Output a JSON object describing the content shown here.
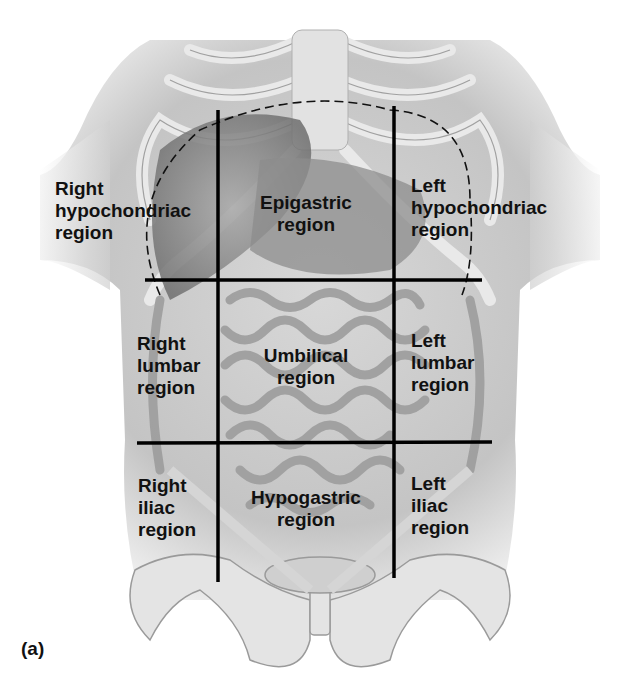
{
  "figure_label": "(a)",
  "regions": {
    "right_hypochondriac": "Right\nhypochondriac\nregion",
    "epigastric": "Epigastric\nregion",
    "left_hypochondriac": "Left\nhypochondriac\nregion",
    "right_lumbar": "Right\nlumbar\nregion",
    "umbilical": "Umbilical\nregion",
    "left_lumbar": "Left\nlumbar\nregion",
    "right_iliac": "Right\niliac\nregion",
    "hypogastric": "Hypogastric\nregion",
    "left_iliac": "Left\niliac\nregion"
  },
  "colors": {
    "lines": "#000000",
    "text": "#111111",
    "illustration": "#9a9a9a"
  }
}
